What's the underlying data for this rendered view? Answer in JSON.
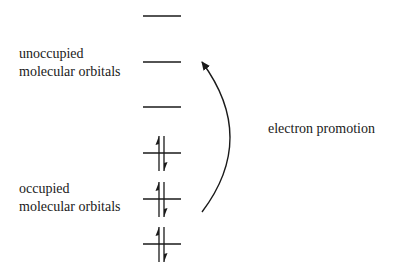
{
  "labels": {
    "unoccupied": [
      "unoccupied",
      "molecular orbitals"
    ],
    "occupied": [
      "occupied",
      "molecular orbitals"
    ],
    "promotion": "electron promotion"
  },
  "orbitals": {
    "unoccupied_levels": 3,
    "occupied_levels": 3,
    "electrons_per_occupied": 2
  },
  "colors": {
    "line": "#1a1a1a",
    "background": "#ffffff"
  }
}
